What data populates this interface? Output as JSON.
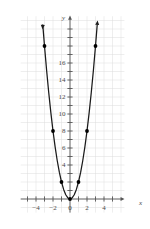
{
  "chart_data": {
    "type": "scatter",
    "title": "",
    "subtitle": "",
    "xlabel": "x",
    "ylabel": "y",
    "xlim": [
      -5.8,
      6.4
    ],
    "ylim": [
      -1.6,
      21.5
    ],
    "grid": true,
    "grid_spacing": 1,
    "grid_color": "#dcdcdc",
    "axis_color": "#555555",
    "curve_color": "#1a1a1a",
    "point_color": "#000000",
    "legend": "none",
    "equation": "y = 2x^2",
    "x_ticks": [
      -5,
      -4,
      -3,
      -2,
      -1,
      0,
      1,
      2,
      3,
      4,
      5
    ],
    "x_tick_labels": [
      {
        "value": -4,
        "label": "−4"
      },
      {
        "value": -2,
        "label": "−2"
      },
      {
        "value": 0,
        "label": "0"
      },
      {
        "value": 2,
        "label": "2"
      },
      {
        "value": 4,
        "label": "4"
      }
    ],
    "y_ticks": [
      1,
      2,
      3,
      4,
      5,
      6,
      7,
      8,
      9,
      10,
      11,
      12,
      13,
      14,
      15,
      16,
      17,
      18,
      19,
      20
    ],
    "y_tick_labels": [
      {
        "value": 4,
        "label": "4"
      },
      {
        "value": 6,
        "label": "6"
      },
      {
        "value": 8,
        "label": "8"
      },
      {
        "value": 10,
        "label": "10"
      },
      {
        "value": 12,
        "label": "12"
      },
      {
        "value": 14,
        "label": "14"
      },
      {
        "value": 16,
        "label": "16"
      }
    ],
    "points": [
      {
        "x": -3,
        "y": 18
      },
      {
        "x": -2,
        "y": 8
      },
      {
        "x": -1,
        "y": 2
      },
      {
        "x": 0,
        "y": 0
      },
      {
        "x": 1,
        "y": 2
      },
      {
        "x": 2,
        "y": 8
      },
      {
        "x": 3,
        "y": 18
      }
    ],
    "series": [
      {
        "name": "y = 2x^2",
        "x": [
          -3.2,
          -3.0,
          -2.75,
          -2.5,
          -2.25,
          -2.0,
          -1.75,
          -1.5,
          -1.25,
          -1.0,
          -0.75,
          -0.5,
          -0.25,
          0,
          0.25,
          0.5,
          0.75,
          1.0,
          1.25,
          1.5,
          1.75,
          2.0,
          2.25,
          2.5,
          2.75,
          3.0,
          3.2
        ],
        "values": [
          20.48,
          18.0,
          15.125,
          12.5,
          10.125,
          8.0,
          6.125,
          4.5,
          3.125,
          2.0,
          1.125,
          0.5,
          0.125,
          0,
          0.125,
          0.5,
          1.125,
          2.0,
          3.125,
          4.5,
          6.125,
          8.0,
          10.125,
          12.5,
          15.125,
          18.0,
          20.48
        ]
      }
    ],
    "arrows": {
      "x_axis_positive": true,
      "y_axis_positive": true,
      "curve_left_end": true,
      "curve_right_end": true
    }
  }
}
